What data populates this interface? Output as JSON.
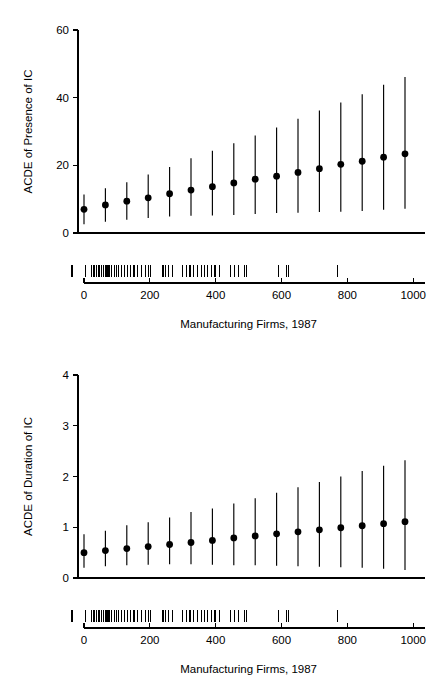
{
  "figure": {
    "background_color": "#ffffff",
    "ink_color": "#000000",
    "panel_count": 2
  },
  "chart_data": [
    {
      "type": "scatter",
      "title": "",
      "subtitle": "",
      "xlabel": "Manufacturing Firms, 1987",
      "ylabel": "ACDE of Presence of IC",
      "xlim": [
        -30,
        1010
      ],
      "ylim": [
        0,
        60
      ],
      "xticks": [
        0,
        200,
        400,
        600,
        800,
        1000
      ],
      "xtick_labels": [
        "0",
        "200",
        "400",
        "600",
        "800",
        "1000"
      ],
      "yticks": [
        0,
        20,
        40,
        60
      ],
      "ytick_labels": [
        "0",
        "20",
        "40",
        "60"
      ],
      "grid": false,
      "legend": "none",
      "error_bars": "vertical",
      "x": [
        0,
        65,
        130,
        195,
        260,
        325,
        390,
        455,
        520,
        585,
        650,
        715,
        780,
        845,
        910,
        975
      ],
      "values": [
        7.0,
        8.3,
        9.4,
        10.4,
        11.6,
        12.7,
        13.7,
        14.8,
        15.9,
        16.8,
        17.9,
        19.0,
        20.3,
        21.2,
        22.4,
        23.4
      ],
      "ci_lower": [
        2.6,
        3.3,
        3.9,
        4.4,
        4.9,
        5.1,
        5.2,
        5.3,
        5.6,
        5.9,
        6.0,
        6.2,
        6.3,
        6.5,
        6.9,
        7.2
      ],
      "ci_upper": [
        11.4,
        13.2,
        15.0,
        17.3,
        19.5,
        22.1,
        24.3,
        26.5,
        28.8,
        31.2,
        33.8,
        36.2,
        38.6,
        41.0,
        43.8,
        46.1
      ],
      "rug_values": [
        5,
        22,
        28,
        33,
        38,
        43,
        48,
        53,
        58,
        64,
        70,
        76,
        83,
        92,
        99,
        106,
        113,
        124,
        131,
        140,
        152,
        163,
        175,
        186,
        196,
        203,
        240,
        248,
        258,
        268,
        300,
        310,
        322,
        332,
        344,
        356,
        366,
        376,
        386,
        398,
        412,
        446,
        456,
        470,
        488,
        494,
        592,
        614,
        622,
        770
      ],
      "rug_position": "below-axis"
    },
    {
      "type": "scatter",
      "title": "",
      "subtitle": "",
      "xlabel": "Manufacturing Firms, 1987",
      "ylabel": "ACDE of Duration of IC",
      "xlim": [
        -30,
        1010
      ],
      "ylim": [
        0,
        4
      ],
      "xticks": [
        0,
        200,
        400,
        600,
        800,
        1000
      ],
      "xtick_labels": [
        "0",
        "200",
        "400",
        "600",
        "800",
        "1000"
      ],
      "yticks": [
        0,
        1,
        2,
        3,
        4
      ],
      "ytick_labels": [
        "0",
        "1",
        "2",
        "3",
        "4"
      ],
      "grid": false,
      "legend": "none",
      "error_bars": "vertical",
      "x": [
        0,
        65,
        130,
        195,
        260,
        325,
        390,
        455,
        520,
        585,
        650,
        715,
        780,
        845,
        910,
        975
      ],
      "values": [
        0.5,
        0.54,
        0.58,
        0.62,
        0.66,
        0.7,
        0.74,
        0.79,
        0.83,
        0.87,
        0.91,
        0.95,
        0.99,
        1.03,
        1.07,
        1.11
      ],
      "ci_lower": [
        0.2,
        0.23,
        0.25,
        0.26,
        0.27,
        0.27,
        0.26,
        0.25,
        0.25,
        0.24,
        0.23,
        0.22,
        0.21,
        0.2,
        0.18,
        0.16
      ],
      "ci_upper": [
        0.86,
        0.93,
        1.04,
        1.1,
        1.19,
        1.3,
        1.37,
        1.47,
        1.57,
        1.68,
        1.79,
        1.89,
        2.0,
        2.11,
        2.21,
        2.32
      ],
      "rug_values": [
        5,
        22,
        28,
        33,
        38,
        43,
        48,
        53,
        58,
        64,
        70,
        76,
        83,
        92,
        99,
        106,
        113,
        124,
        131,
        140,
        152,
        163,
        175,
        186,
        196,
        203,
        240,
        248,
        258,
        268,
        300,
        310,
        322,
        332,
        344,
        356,
        366,
        376,
        386,
        398,
        412,
        446,
        456,
        470,
        488,
        494,
        592,
        614,
        622,
        770
      ],
      "rug_position": "below-axis"
    }
  ]
}
